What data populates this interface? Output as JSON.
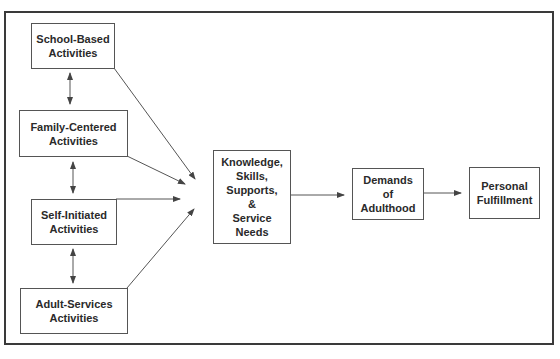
{
  "nodes": {
    "school": {
      "lines": [
        "School-Based",
        "Activities"
      ]
    },
    "family": {
      "lines": [
        "Family-Centered",
        "Activities"
      ]
    },
    "self": {
      "lines": [
        "Self-Initiated",
        "Activities"
      ]
    },
    "adult": {
      "lines": [
        "Adult-Services",
        "Activities"
      ]
    },
    "knowledge": {
      "lines": [
        "Knowledge,",
        "Skills,",
        "Supports,",
        "&",
        "Service",
        "Needs"
      ]
    },
    "demands": {
      "lines": [
        "Demands",
        "of",
        "Adulthood"
      ]
    },
    "personal": {
      "lines": [
        "Personal",
        "Fulfillment"
      ]
    }
  },
  "edges": [
    {
      "from": "school",
      "to": "knowledge",
      "type": "arrow"
    },
    {
      "from": "family",
      "to": "knowledge",
      "type": "arrow"
    },
    {
      "from": "self",
      "to": "knowledge",
      "type": "arrow"
    },
    {
      "from": "adult",
      "to": "knowledge",
      "type": "arrow"
    },
    {
      "from": "school",
      "to": "family",
      "type": "bidirectional"
    },
    {
      "from": "family",
      "to": "self",
      "type": "bidirectional"
    },
    {
      "from": "self",
      "to": "adult",
      "type": "bidirectional"
    },
    {
      "from": "knowledge",
      "to": "demands",
      "type": "arrow"
    },
    {
      "from": "demands",
      "to": "personal",
      "type": "arrow"
    }
  ]
}
